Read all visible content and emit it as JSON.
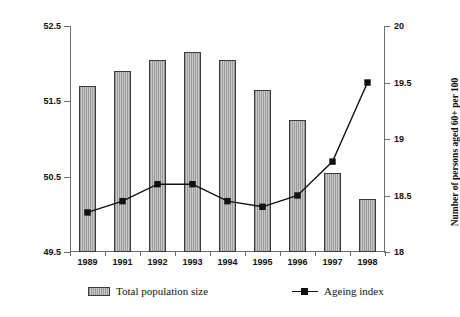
{
  "chart_data": {
    "type": "bar",
    "title": "",
    "categories": [
      "1989",
      "1991",
      "1992",
      "1993",
      "1994",
      "1995",
      "1996",
      "1997",
      "1998"
    ],
    "xlabel": "",
    "grid": false,
    "legend_position": "bottom",
    "series": [
      {
        "name": "Total population size",
        "type": "bar",
        "axis": "left",
        "values": [
          51.7,
          51.9,
          52.05,
          52.15,
          52.05,
          51.65,
          51.25,
          50.55,
          50.2
        ]
      },
      {
        "name": "Ageing index",
        "type": "line",
        "axis": "right",
        "values": [
          18.35,
          18.45,
          18.6,
          18.6,
          18.45,
          18.4,
          18.5,
          18.8,
          19.5
        ]
      }
    ],
    "left_axis": {
      "label": "Total population (millions)",
      "ylim": [
        49.5,
        52.5
      ],
      "ticks": [
        "49.5",
        "50.5",
        "51.5",
        "52.5"
      ],
      "tick_values": [
        49.5,
        50.5,
        51.5,
        52.5
      ]
    },
    "right_axis": {
      "label": "Number of persons aged 60+ per 100",
      "ylim": [
        18,
        20
      ],
      "ticks": [
        "18",
        "18.5",
        "19",
        "19.5",
        "20"
      ],
      "tick_values": [
        18,
        18.5,
        19,
        19.5,
        20
      ]
    },
    "colors": {
      "bar_fill": "#c0c0c0",
      "bar_border": "#3a3a3a",
      "line": "#111111",
      "marker": "#111111",
      "axis": "#6e6e6e",
      "background": "#ffffff"
    }
  },
  "legend": {
    "bars_label": "Total population size",
    "line_label": "Ageing index"
  }
}
